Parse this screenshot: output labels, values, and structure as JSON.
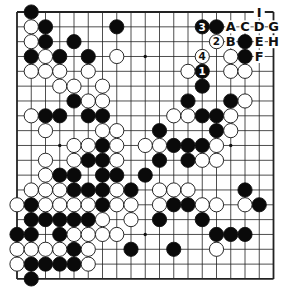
{
  "board": {
    "size": 19,
    "origin": {
      "x": 17,
      "y": 12
    },
    "spacing": {
      "x": 14.25,
      "y": 14.83
    },
    "line_color": "#222222",
    "star_points": [
      [
        3,
        3
      ],
      [
        9,
        3
      ],
      [
        15,
        3
      ],
      [
        3,
        9
      ],
      [
        9,
        9
      ],
      [
        15,
        9
      ],
      [
        3,
        15
      ],
      [
        9,
        15
      ],
      [
        15,
        15
      ]
    ]
  },
  "stones": {
    "black": [
      [
        1,
        0
      ],
      [
        2,
        1
      ],
      [
        7,
        1
      ],
      [
        13,
        1,
        "3"
      ],
      [
        14,
        1
      ],
      [
        2,
        2
      ],
      [
        4,
        2
      ],
      [
        16,
        2
      ],
      [
        1,
        3
      ],
      [
        3,
        3
      ],
      [
        5,
        3
      ],
      [
        16,
        3
      ],
      [
        13,
        4,
        "1"
      ],
      [
        13,
        5
      ],
      [
        4,
        6
      ],
      [
        12,
        6
      ],
      [
        15,
        6
      ],
      [
        2,
        7
      ],
      [
        3,
        7
      ],
      [
        5,
        7
      ],
      [
        6,
        7
      ],
      [
        13,
        7
      ],
      [
        14,
        7
      ],
      [
        10,
        8
      ],
      [
        14,
        8
      ],
      [
        6,
        9
      ],
      [
        11,
        9
      ],
      [
        12,
        9
      ],
      [
        13,
        9
      ],
      [
        5,
        10
      ],
      [
        6,
        10
      ],
      [
        10,
        10
      ],
      [
        12,
        10
      ],
      [
        3,
        11
      ],
      [
        4,
        11
      ],
      [
        6,
        11
      ],
      [
        7,
        11
      ],
      [
        9,
        11
      ],
      [
        4,
        12
      ],
      [
        5,
        12
      ],
      [
        6,
        12
      ],
      [
        8,
        12
      ],
      [
        16,
        12
      ],
      [
        1,
        13
      ],
      [
        6,
        13
      ],
      [
        11,
        13
      ],
      [
        12,
        13
      ],
      [
        17,
        13
      ],
      [
        1,
        14
      ],
      [
        2,
        14
      ],
      [
        3,
        14
      ],
      [
        4,
        14
      ],
      [
        5,
        14
      ],
      [
        10,
        14
      ],
      [
        13,
        14
      ],
      [
        0,
        15
      ],
      [
        1,
        15
      ],
      [
        3,
        15
      ],
      [
        14,
        15
      ],
      [
        15,
        15
      ],
      [
        16,
        15
      ],
      [
        4,
        16
      ],
      [
        8,
        16
      ],
      [
        11,
        16
      ],
      [
        1,
        17
      ],
      [
        2,
        17
      ],
      [
        3,
        17
      ],
      [
        4,
        17
      ],
      [
        1,
        18
      ]
    ],
    "white": [
      [
        1,
        1
      ],
      [
        1,
        2
      ],
      [
        14,
        2,
        "2"
      ],
      [
        2,
        3
      ],
      [
        7,
        3
      ],
      [
        13,
        3,
        "4"
      ],
      [
        15,
        3
      ],
      [
        1,
        4
      ],
      [
        2,
        4
      ],
      [
        3,
        4
      ],
      [
        5,
        4
      ],
      [
        12,
        4
      ],
      [
        15,
        4
      ],
      [
        16,
        4
      ],
      [
        3,
        5
      ],
      [
        4,
        5
      ],
      [
        6,
        5
      ],
      [
        5,
        6
      ],
      [
        6,
        6
      ],
      [
        16,
        6
      ],
      [
        1,
        7
      ],
      [
        11,
        7
      ],
      [
        12,
        7
      ],
      [
        15,
        7
      ],
      [
        2,
        8
      ],
      [
        6,
        8
      ],
      [
        7,
        8
      ],
      [
        15,
        8
      ],
      [
        4,
        9
      ],
      [
        5,
        9
      ],
      [
        7,
        9
      ],
      [
        9,
        9
      ],
      [
        10,
        9
      ],
      [
        14,
        9
      ],
      [
        2,
        10
      ],
      [
        4,
        10
      ],
      [
        7,
        10
      ],
      [
        13,
        10
      ],
      [
        14,
        10
      ],
      [
        2,
        11
      ],
      [
        1,
        12
      ],
      [
        2,
        12
      ],
      [
        3,
        12
      ],
      [
        7,
        12
      ],
      [
        10,
        12
      ],
      [
        11,
        12
      ],
      [
        12,
        12
      ],
      [
        0,
        13
      ],
      [
        2,
        13
      ],
      [
        3,
        13
      ],
      [
        4,
        13
      ],
      [
        5,
        13
      ],
      [
        7,
        13
      ],
      [
        8,
        13
      ],
      [
        10,
        13
      ],
      [
        13,
        13
      ],
      [
        14,
        13
      ],
      [
        16,
        13
      ],
      [
        6,
        14
      ],
      [
        8,
        14
      ],
      [
        4,
        15
      ],
      [
        5,
        15
      ],
      [
        6,
        15
      ],
      [
        7,
        15
      ],
      [
        0,
        16
      ],
      [
        1,
        16
      ],
      [
        2,
        16
      ],
      [
        3,
        16
      ],
      [
        5,
        16
      ],
      [
        14,
        16
      ],
      [
        0,
        17
      ],
      [
        5,
        17
      ]
    ]
  },
  "point_labels": [
    {
      "col": 15,
      "row": 1,
      "text": "A"
    },
    {
      "col": 16,
      "row": 1,
      "text": "C"
    },
    {
      "col": 17,
      "row": 1,
      "text": "D"
    },
    {
      "col": 18,
      "row": 1,
      "text": "G"
    },
    {
      "col": 15,
      "row": 2,
      "text": "B"
    },
    {
      "col": 17,
      "row": 2,
      "text": "E"
    },
    {
      "col": 18,
      "row": 2,
      "text": "H"
    },
    {
      "col": 17,
      "row": 3,
      "text": "F"
    },
    {
      "col": 17,
      "row": 0,
      "text": "I"
    }
  ]
}
